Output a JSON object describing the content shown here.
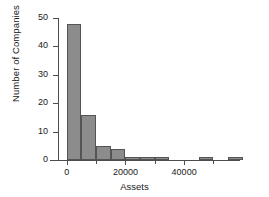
{
  "chart_data": {
    "type": "bar",
    "title": "",
    "xlabel": "Assets",
    "ylabel": "Number of Companies",
    "xlim": [
      -3000,
      57000
    ],
    "ylim": [
      0,
      50
    ],
    "grid": false,
    "legend": null,
    "bin_width": 5000,
    "x_ticks": [
      {
        "value": 0,
        "label": "0",
        "major": true
      },
      {
        "value": 10000,
        "label": "",
        "major": false
      },
      {
        "value": 20000,
        "label": "20000",
        "major": true
      },
      {
        "value": 30000,
        "label": "",
        "major": false
      },
      {
        "value": 40000,
        "label": "40000",
        "major": true
      },
      {
        "value": 50000,
        "label": "",
        "major": false
      }
    ],
    "y_ticks": [
      {
        "value": 0,
        "label": "0"
      },
      {
        "value": 10,
        "label": "10"
      },
      {
        "value": 20,
        "label": "20"
      },
      {
        "value": 30,
        "label": "30"
      },
      {
        "value": 40,
        "label": "40"
      },
      {
        "value": 50,
        "label": "50"
      }
    ],
    "bins": [
      {
        "x0": 0,
        "x1": 5000,
        "value": 48
      },
      {
        "x0": 5000,
        "x1": 10000,
        "value": 16
      },
      {
        "x0": 10000,
        "x1": 15000,
        "value": 5
      },
      {
        "x0": 15000,
        "x1": 20000,
        "value": 4
      },
      {
        "x0": 20000,
        "x1": 25000,
        "value": 1
      },
      {
        "x0": 25000,
        "x1": 30000,
        "value": 1
      },
      {
        "x0": 30000,
        "x1": 35000,
        "value": 1
      },
      {
        "x0": 35000,
        "x1": 40000,
        "value": 0
      },
      {
        "x0": 40000,
        "x1": 45000,
        "value": 0
      },
      {
        "x0": 45000,
        "x1": 50000,
        "value": 1
      },
      {
        "x0": 50000,
        "x1": 55000,
        "value": 0
      },
      {
        "x0": 55000,
        "x1": 60000,
        "value": 1
      }
    ],
    "categories": [
      "0-5000",
      "5000-10000",
      "10000-15000",
      "15000-20000",
      "20000-25000",
      "25000-30000",
      "30000-35000",
      "35000-40000",
      "40000-45000",
      "45000-50000",
      "50000-55000",
      "55000-60000"
    ],
    "values": [
      48,
      16,
      5,
      4,
      1,
      1,
      1,
      0,
      0,
      1,
      0,
      1
    ],
    "colors": {
      "bar_fill": "#8c8c8c",
      "bar_stroke": "#545454",
      "axis": "#4d4d4d",
      "text": "#1a1a1a",
      "background": "#ffffff"
    }
  }
}
